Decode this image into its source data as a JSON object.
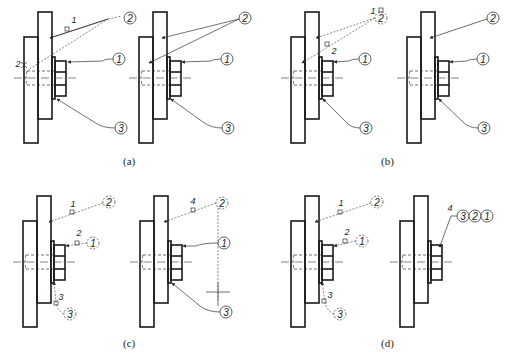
{
  "captions": [
    "(a)",
    "(b)",
    "(c)",
    "(d)"
  ],
  "balloons": {
    "part1": "1",
    "part2": "2",
    "part3": "3"
  },
  "steps": {
    "s1": "1",
    "s2": "2",
    "s3": "3",
    "s4": "4"
  },
  "colors": {
    "line": "#1a1a1a",
    "background": "#ffffff"
  }
}
